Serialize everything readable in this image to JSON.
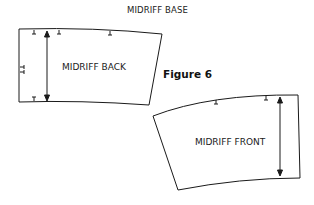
{
  "title": "MIDRIFF BASE",
  "figure_label": "Figure 6",
  "pieces": [
    {
      "name": "MIDRIFF BACK"
    },
    {
      "name": "MIDRIFF FRONT"
    }
  ],
  "colors": {
    "line": "#1a1a1a",
    "background": "#ffffff"
  }
}
